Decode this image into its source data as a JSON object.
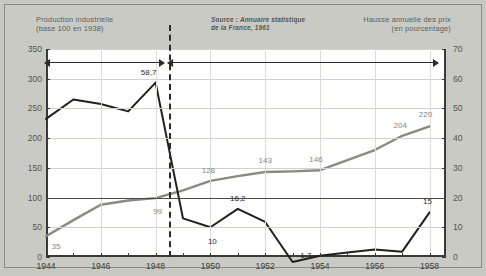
{
  "header": {
    "left_title": "Production industrielle\n(base 100 en 1938)",
    "source": "Source : Annuaire statistique\nde la France, 1961",
    "right_title": "Hausse annuelle des prix\n(en pourcentage)"
  },
  "annotations": {
    "reconstruction": "La reconstruction",
    "cycle": "Début du grand cycle\nd'expansion des « 30 glorieuses »"
  },
  "chart_data": {
    "type": "line",
    "title": "",
    "xlabel": "",
    "grid": true,
    "legend": "none",
    "x": [
      1944,
      1945,
      1946,
      1947,
      1948,
      1949,
      1950,
      1951,
      1952,
      1953,
      1954,
      1955,
      1956,
      1957,
      1958
    ],
    "xticks": [
      "1944",
      "1946",
      "1948",
      "1950",
      "1952",
      "1954",
      "1956",
      "1958"
    ],
    "axes": [
      {
        "id": "left",
        "label": "Production industrielle (base 100 en 1938)",
        "ylim": [
          0,
          350
        ],
        "yticks": [
          "0",
          "50",
          "100",
          "150",
          "200",
          "250",
          "300",
          "350"
        ]
      },
      {
        "id": "right",
        "label": "Hausse annuelle des prix (en pourcentage)",
        "ylim": [
          0,
          70
        ],
        "yticks": [
          "0",
          "10",
          "20",
          "30",
          "40",
          "50",
          "60",
          "70"
        ]
      }
    ],
    "series": [
      {
        "name": "Production industrielle",
        "axis": "left",
        "color": "#8a8a83",
        "values": [
          35,
          62,
          88,
          95,
          99,
          112,
          128,
          136,
          143,
          144,
          146,
          163,
          180,
          204,
          220
        ],
        "labels": [
          {
            "x": 1944,
            "value": 35,
            "text": "35"
          },
          {
            "x": 1948,
            "value": 99,
            "text": "99"
          },
          {
            "x": 1950,
            "value": 128,
            "text": "128"
          },
          {
            "x": 1952,
            "value": 143,
            "text": "143"
          },
          {
            "x": 1954,
            "value": 146,
            "text": "146"
          },
          {
            "x": 1957,
            "value": 204,
            "text": "204"
          },
          {
            "x": 1958,
            "value": 220,
            "text": "220"
          }
        ]
      },
      {
        "name": "Hausse annuelle des prix",
        "axis": "right",
        "color": "#1f1f1d",
        "values": [
          46.5,
          53.0,
          51.5,
          49.0,
          58.7,
          13.0,
          10.0,
          16.2,
          11.8,
          -1.7,
          0.4,
          1.5,
          2.5,
          1.8,
          15.0
        ],
        "labels": [
          {
            "x": 1948,
            "value": 58.7,
            "text": "58,7"
          },
          {
            "x": 1950,
            "value": 10.0,
            "text": "10"
          },
          {
            "x": 1951,
            "value": 16.2,
            "text": "16,2"
          },
          {
            "x": 1953,
            "value": -1.7,
            "text": "-1,7"
          },
          {
            "x": 1958,
            "value": 15.0,
            "text": "15"
          }
        ]
      }
    ],
    "reference_lines": [
      {
        "axis": "left",
        "value": 100,
        "style": "solid",
        "color": "#6f6f69"
      },
      {
        "axis": "right",
        "value": 20,
        "style": "solid",
        "color": "#4a4a45"
      },
      {
        "axis": "x",
        "value": 1948.5,
        "style": "dashed",
        "color": "#2b2b28"
      }
    ]
  }
}
